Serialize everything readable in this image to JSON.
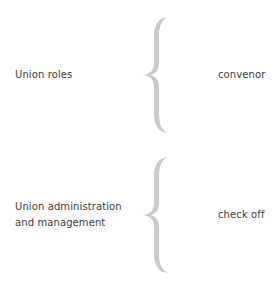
{
  "diagram": {
    "rows": [
      {
        "left_lines": [
          "Union roles"
        ],
        "right": "convenor"
      },
      {
        "left_lines": [
          "Union administration",
          "and management"
        ],
        "right": "check off"
      }
    ],
    "brace_color": "#c9c9c9",
    "text_color": "#3a3a3a"
  }
}
